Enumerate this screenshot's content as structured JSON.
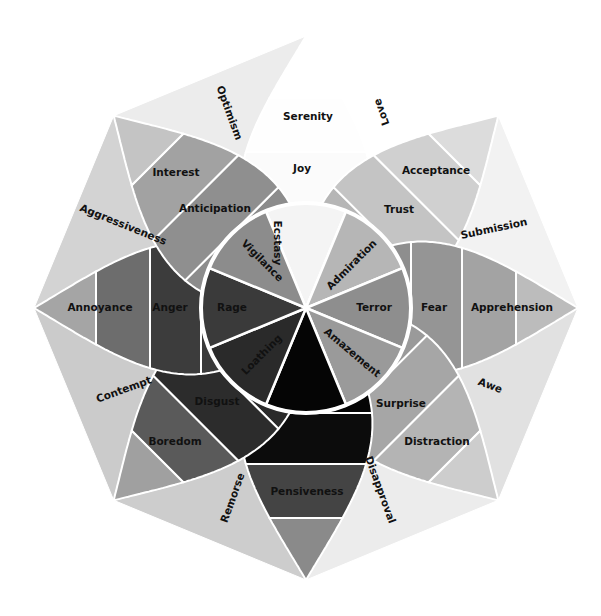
{
  "diagram": {
    "center": [
      306,
      308
    ],
    "inner_radius": 105,
    "ring_radii": [
      105,
      156,
      210
    ],
    "tip_radius": 272,
    "colors": {
      "background": "#ffffff",
      "lines": "#ffffff",
      "text": "#111111"
    },
    "petals": [
      {
        "direction": "up",
        "angle": 0,
        "inner": "Ecstasy",
        "middle": "Joy",
        "outer": "Serenity",
        "fills": [
          "#f4f4f4",
          "#fbfbfb",
          "#fefefe",
          "#ffffff"
        ]
      },
      {
        "direction": "up-right",
        "angle": 45,
        "inner": "Admiration",
        "middle": "Trust",
        "outer": "Acceptance",
        "fills": [
          "#b6b6b6",
          "#c4c4c4",
          "#d0d0d0",
          "#dcdcdc"
        ]
      },
      {
        "direction": "right",
        "angle": 90,
        "inner": "Terror",
        "middle": "Fear",
        "outer": "Apprehension",
        "fills": [
          "#8e8e8e",
          "#959595",
          "#a3a3a3",
          "#bcbcbc"
        ]
      },
      {
        "direction": "down-right",
        "angle": 135,
        "inner": "Amazement",
        "middle": "Surprise",
        "outer": "Distraction",
        "fills": [
          "#9a9a9a",
          "#a6a6a6",
          "#b4b4b4",
          "#cdcdcd"
        ]
      },
      {
        "direction": "down",
        "angle": 180,
        "inner": "",
        "middle": "",
        "outer": "Pensiveness",
        "fills": [
          "#050505",
          "#0c0c0c",
          "#444444",
          "#8a8a8a"
        ]
      },
      {
        "direction": "down-left",
        "angle": 225,
        "inner": "Loathing",
        "middle": "Disgust",
        "outer": "Boredom",
        "fills": [
          "#2a2a2a",
          "#2c2c2c",
          "#5a5a5a",
          "#a0a0a0"
        ]
      },
      {
        "direction": "left",
        "angle": 270,
        "inner": "Rage",
        "middle": "Anger",
        "outer": "Annoyance",
        "fills": [
          "#3a3a3a",
          "#3c3c3c",
          "#6d6d6d",
          "#a5a5a5"
        ]
      },
      {
        "direction": "up-left",
        "angle": 315,
        "inner": "Vigilance",
        "middle": "Anticipation",
        "outer": "Interest",
        "fills": [
          "#8c8c8c",
          "#8f8f8f",
          "#a2a2a2",
          "#c4c4c4"
        ]
      }
    ],
    "dyads": [
      {
        "label": "Love",
        "between": [
          "Joy",
          "Trust"
        ],
        "fill": "#ffffff"
      },
      {
        "label": "Submission",
        "between": [
          "Trust",
          "Fear"
        ],
        "fill": "#f2f2f2"
      },
      {
        "label": "Awe",
        "between": [
          "Fear",
          "Surprise"
        ],
        "fill": "#e1e1e1"
      },
      {
        "label": "Disapproval",
        "between": [
          "Surprise",
          "Sadness"
        ],
        "fill": "#ececec"
      },
      {
        "label": "Remorse",
        "between": [
          "Sadness",
          "Disgust"
        ],
        "fill": "#cdcdcd"
      },
      {
        "label": "Contempt",
        "between": [
          "Disgust",
          "Anger"
        ],
        "fill": "#cbcbcb"
      },
      {
        "label": "Aggressiveness",
        "between": [
          "Anger",
          "Anticipation"
        ],
        "fill": "#d3d3d3"
      },
      {
        "label": "Optimism",
        "between": [
          "Anticipation",
          "Joy"
        ],
        "fill": "#ececec"
      }
    ]
  }
}
